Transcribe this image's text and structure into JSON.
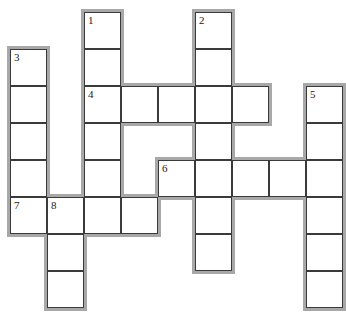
{
  "puzzle": {
    "type": "crossword",
    "cell_size_px": 37,
    "origin_px": [
      10,
      12
    ],
    "colors": {
      "cell_fill": "#ffffff",
      "grid_line": "#3a3a3a",
      "outline": "#a8a8a8"
    },
    "clues": [
      {
        "number": "1",
        "direction": "down",
        "row": 0,
        "col": 2,
        "length": 6
      },
      {
        "number": "2",
        "direction": "down",
        "row": 0,
        "col": 5,
        "length": 7
      },
      {
        "number": "3",
        "direction": "down",
        "row": 1,
        "col": 0,
        "length": 5
      },
      {
        "number": "4",
        "direction": "across",
        "row": 2,
        "col": 2,
        "length": 5
      },
      {
        "number": "5",
        "direction": "down",
        "row": 2,
        "col": 8,
        "length": 6
      },
      {
        "number": "6",
        "direction": "across",
        "row": 4,
        "col": 4,
        "length": 5
      },
      {
        "number": "7",
        "direction": "across",
        "row": 5,
        "col": 0,
        "length": 4
      },
      {
        "number": "8",
        "direction": "down",
        "row": 5,
        "col": 1,
        "length": 3
      }
    ]
  }
}
